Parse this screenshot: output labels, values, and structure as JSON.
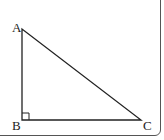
{
  "diagram": {
    "type": "right-triangle",
    "vertices": [
      {
        "label": "A",
        "x": 22,
        "y": 29
      },
      {
        "label": "B",
        "x": 22,
        "y": 120
      },
      {
        "label": "C",
        "x": 141,
        "y": 120
      }
    ],
    "right_angle_at": "B",
    "stroke_color": "#222222"
  }
}
